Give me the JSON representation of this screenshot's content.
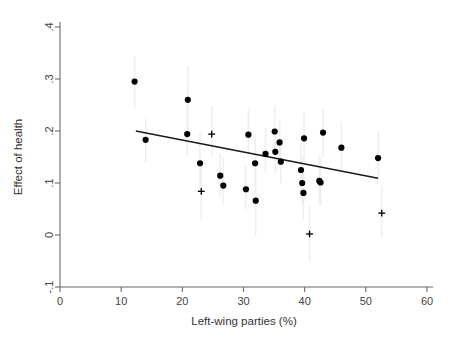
{
  "chart_data": {
    "type": "scatter",
    "title": "",
    "xlabel": "Left-wing parties (%)",
    "ylabel": "Effect of health",
    "xlim": [
      0,
      60
    ],
    "ylim": [
      -0.1,
      0.4
    ],
    "xticks": [
      0,
      10,
      20,
      30,
      40,
      50,
      60
    ],
    "xtick_labels": [
      "0",
      "10",
      "20",
      "30",
      "40",
      "50",
      "60"
    ],
    "yticks": [
      -0.1,
      0,
      0.1,
      0.2,
      0.3,
      0.4
    ],
    "ytick_labels": [
      "-.1",
      "0",
      ".1",
      ".2",
      ".3",
      ".4"
    ],
    "grid": false,
    "legend": null,
    "marker_color": "#000000",
    "errorbar_color": "#efefef",
    "fitline_color": "#1a1a1a",
    "series": [
      {
        "name": "significant",
        "marker": "circle",
        "points": [
          {
            "x": 12.2,
            "y": 0.295,
            "lo": 0.245,
            "hi": 0.345
          },
          {
            "x": 14.0,
            "y": 0.183,
            "lo": 0.14,
            "hi": 0.228
          },
          {
            "x": 20.9,
            "y": 0.26,
            "lo": 0.195,
            "hi": 0.325
          },
          {
            "x": 20.8,
            "y": 0.194,
            "lo": 0.15,
            "hi": 0.272
          },
          {
            "x": 22.9,
            "y": 0.138,
            "lo": 0.088,
            "hi": 0.196
          },
          {
            "x": 26.2,
            "y": 0.114,
            "lo": 0.072,
            "hi": 0.158
          },
          {
            "x": 26.7,
            "y": 0.095,
            "lo": 0.06,
            "hi": 0.15
          },
          {
            "x": 30.4,
            "y": 0.088,
            "lo": 0.048,
            "hi": 0.135
          },
          {
            "x": 30.8,
            "y": 0.193,
            "lo": 0.15,
            "hi": 0.242
          },
          {
            "x": 31.9,
            "y": 0.138,
            "lo": 0.093,
            "hi": 0.19
          },
          {
            "x": 32.0,
            "y": 0.066,
            "lo": 0.0,
            "hi": 0.128
          },
          {
            "x": 33.6,
            "y": 0.156,
            "lo": 0.12,
            "hi": 0.206
          },
          {
            "x": 35.1,
            "y": 0.199,
            "lo": 0.16,
            "hi": 0.248
          },
          {
            "x": 35.2,
            "y": 0.16,
            "lo": 0.118,
            "hi": 0.205
          },
          {
            "x": 35.9,
            "y": 0.178,
            "lo": 0.14,
            "hi": 0.222
          },
          {
            "x": 36.1,
            "y": 0.141,
            "lo": 0.1,
            "hi": 0.186
          },
          {
            "x": 39.4,
            "y": 0.125,
            "lo": 0.078,
            "hi": 0.175
          },
          {
            "x": 39.6,
            "y": 0.1,
            "lo": 0.058,
            "hi": 0.148
          },
          {
            "x": 39.8,
            "y": 0.081,
            "lo": 0.03,
            "hi": 0.132
          },
          {
            "x": 39.9,
            "y": 0.186,
            "lo": 0.14,
            "hi": 0.235
          },
          {
            "x": 42.4,
            "y": 0.104,
            "lo": 0.06,
            "hi": 0.152
          },
          {
            "x": 42.6,
            "y": 0.101,
            "lo": 0.055,
            "hi": 0.148
          },
          {
            "x": 43.0,
            "y": 0.197,
            "lo": 0.15,
            "hi": 0.244
          },
          {
            "x": 46.0,
            "y": 0.168,
            "lo": 0.118,
            "hi": 0.218
          },
          {
            "x": 52.0,
            "y": 0.148,
            "lo": 0.1,
            "hi": 0.2
          }
        ]
      },
      {
        "name": "non-significant",
        "marker": "plus",
        "points": [
          {
            "x": 24.8,
            "y": 0.194,
            "lo": 0.15,
            "hi": 0.248
          },
          {
            "x": 23.1,
            "y": 0.084,
            "lo": 0.03,
            "hi": 0.138
          },
          {
            "x": 40.8,
            "y": 0.002,
            "lo": -0.052,
            "hi": 0.058
          },
          {
            "x": 52.6,
            "y": 0.042,
            "lo": -0.005,
            "hi": 0.095
          }
        ]
      }
    ],
    "fit_line": {
      "x0": 12.4,
      "y0": 0.2,
      "x1": 52.0,
      "y1": 0.109
    }
  }
}
